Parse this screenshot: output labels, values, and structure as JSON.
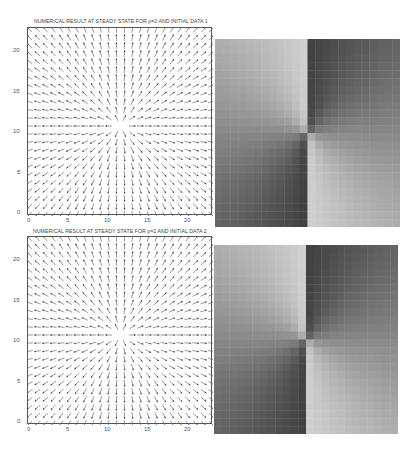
{
  "figure": {
    "panels": [
      {
        "title": "NUMERICAL RESULT AT STEADY STATE FOR p=2 AND INITIAL DATA 1",
        "xticks": [
          "0",
          "5",
          "10",
          "15",
          "20"
        ],
        "yticks": [
          "0",
          "5",
          "10",
          "15",
          "20"
        ]
      },
      {
        "title": "NUMERICAL RESULT AT STEADY STATE FOR p=2 AND INITIAL DATA 2",
        "xticks": [
          "0",
          "5",
          "10",
          "15",
          "20"
        ],
        "yticks": [
          "0",
          "5",
          "10",
          "15",
          "20"
        ]
      }
    ]
  },
  "chart_data": [
    {
      "type": "quiver",
      "title": "NUMERICAL RESULT AT STEADY STATE FOR p=2 AND INITIAL DATA 1",
      "xlabel": "",
      "ylabel": "",
      "xlim": [
        0,
        23
      ],
      "ylim": [
        0,
        23
      ],
      "xticks": [
        0,
        5,
        10,
        15,
        20
      ],
      "yticks": [
        0,
        5,
        10,
        15,
        20
      ],
      "grid_points": 24,
      "field": "unit radial outward vectors from center",
      "center": [
        11.5,
        11
      ],
      "grid": false
    },
    {
      "type": "heatmap",
      "title": "",
      "colormap": "gray",
      "description": "orientation angle field (period 180 deg) around center defect; light top-left & bottom-right, dark top-right & bottom-left",
      "center_fraction": [
        0.5,
        0.5
      ],
      "value_range": [
        0.25,
        0.82
      ]
    },
    {
      "type": "quiver",
      "title": "NUMERICAL RESULT AT STEADY STATE FOR p=2 AND INITIAL DATA 2",
      "xlabel": "",
      "ylabel": "",
      "xlim": [
        0,
        23
      ],
      "ylim": [
        0,
        23
      ],
      "xticks": [
        0,
        5,
        10,
        15,
        20
      ],
      "yticks": [
        0,
        5,
        10,
        15,
        20
      ],
      "grid_points": 24,
      "field": "unit radial outward vectors from center",
      "center": [
        11.5,
        11
      ],
      "grid": false
    },
    {
      "type": "heatmap",
      "title": "",
      "colormap": "gray",
      "description": "orientation angle field (period 180 deg) around center defect; light top-left & bottom-right, dark top-right & bottom-left",
      "center_fraction": [
        0.5,
        0.5
      ],
      "value_range": [
        0.25,
        0.82
      ]
    }
  ]
}
